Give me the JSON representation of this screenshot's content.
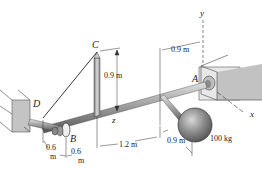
{
  "diagram": {
    "points": {
      "A": "A",
      "B": "B",
      "C": "C",
      "D": "D"
    },
    "axes": {
      "x": "x",
      "y": "y",
      "z": "z"
    },
    "dimensions": {
      "post_height": "0.9 m",
      "A_offset_top": "0.9 m",
      "D_to_B_a": "0.6",
      "D_to_B_a_unit": "m",
      "D_to_B_b": "0.6",
      "D_to_B_b_unit": "m",
      "B_to_arm": "1.2 m",
      "arm_length": "0.9 m"
    },
    "mass_label": "100 kg",
    "colors": {
      "line": "#222222",
      "wall": "#bdbdbd",
      "shaft": "#9a9a9a",
      "sphere": "#8a8a8a"
    }
  }
}
